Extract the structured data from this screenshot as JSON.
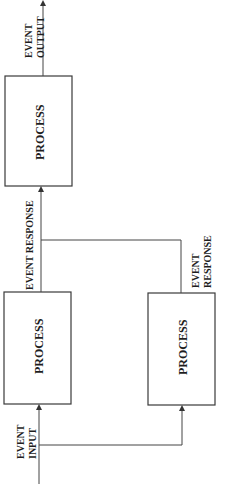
{
  "diagram": {
    "orientation": "rotated-90-ccw",
    "colors": {
      "line": "#444444",
      "text": "#1e1e1e",
      "background": "#ffffff"
    },
    "nodes": [
      {
        "id": "process-top",
        "label": "PROCESS"
      },
      {
        "id": "process-left",
        "label": "PROCESS"
      },
      {
        "id": "process-right",
        "label": "PROCESS"
      }
    ],
    "labels": {
      "event_output_1": "EVENT",
      "event_output_2": "OUTPUT",
      "event_response_main": "EVENT RESPONSE",
      "event_response_1": "EVENT",
      "event_response_2": "RESPONSE",
      "event_input_1": "EVENT",
      "event_input_2": "INPUT"
    },
    "edges": [
      {
        "from": "event-input",
        "to": "process-left"
      },
      {
        "from": "event-input",
        "to": "process-right"
      },
      {
        "from": "process-left",
        "to": "process-top",
        "label": "EVENT RESPONSE"
      },
      {
        "from": "process-right",
        "to": "process-top",
        "label": "EVENT RESPONSE"
      },
      {
        "from": "process-top",
        "to": "event-output",
        "label": "EVENT OUTPUT"
      }
    ]
  }
}
